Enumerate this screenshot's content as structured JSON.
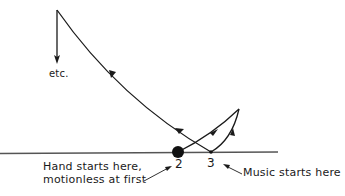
{
  "diagram": {
    "labels": {
      "etc": "etc.",
      "point2": "2",
      "point3": "3",
      "hand_line1": "Hand starts here,",
      "hand_line2": "motionless at first",
      "music": "Music starts here"
    },
    "points": {
      "hand_start": {
        "id": "2",
        "x": 178,
        "y": 152
      },
      "music_start": {
        "id": "3",
        "x": 211,
        "y": 152
      },
      "right_peak": {
        "x": 239,
        "y": 109
      },
      "top_left": {
        "x": 57,
        "y": 10
      },
      "etc_end": {
        "x": 57,
        "y": 64
      }
    },
    "path_sequence": [
      "hand start (2)",
      "up-right to peak",
      "down to music start (3)",
      "long curve up-left to top",
      "down to etc."
    ],
    "colors": {
      "ink": "#1a1a1a",
      "baseline": "#555555",
      "background": "#ffffff"
    }
  }
}
